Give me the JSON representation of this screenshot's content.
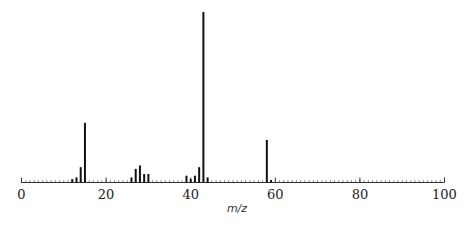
{
  "chart_data": {
    "type": "bar",
    "title": "",
    "xlabel": "m/z",
    "ylabel": "",
    "xlim": [
      0,
      100
    ],
    "ylim": [
      0,
      100
    ],
    "grid": false,
    "legend": null,
    "x_ticks": [
      0,
      20,
      40,
      60,
      80,
      100
    ],
    "x_minor_tick_step": 1,
    "peaks": [
      {
        "mz": 12,
        "intensity": 2
      },
      {
        "mz": 13,
        "intensity": 3
      },
      {
        "mz": 14,
        "intensity": 9
      },
      {
        "mz": 15,
        "intensity": 35
      },
      {
        "mz": 26,
        "intensity": 3
      },
      {
        "mz": 27,
        "intensity": 8
      },
      {
        "mz": 28,
        "intensity": 10
      },
      {
        "mz": 29,
        "intensity": 5
      },
      {
        "mz": 30,
        "intensity": 5
      },
      {
        "mz": 39,
        "intensity": 4
      },
      {
        "mz": 40,
        "intensity": 2
      },
      {
        "mz": 41,
        "intensity": 4
      },
      {
        "mz": 42,
        "intensity": 9
      },
      {
        "mz": 43,
        "intensity": 100
      },
      {
        "mz": 44,
        "intensity": 3
      },
      {
        "mz": 58,
        "intensity": 25
      },
      {
        "mz": 59,
        "intensity": 1.5
      }
    ]
  },
  "colors": {
    "peak": "#111111",
    "axis": "#333333"
  }
}
